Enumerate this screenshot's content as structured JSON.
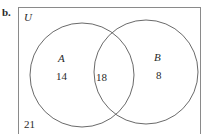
{
  "part_label": "b.",
  "universe_label": "U",
  "sets": [
    {
      "label": "A",
      "only_count": "14"
    },
    {
      "label": "B",
      "only_count": "8"
    }
  ],
  "intersection_count": "18",
  "outside_count": "21",
  "colors": {
    "stroke": "#6a6a6a",
    "text": "#2a2a2a"
  }
}
